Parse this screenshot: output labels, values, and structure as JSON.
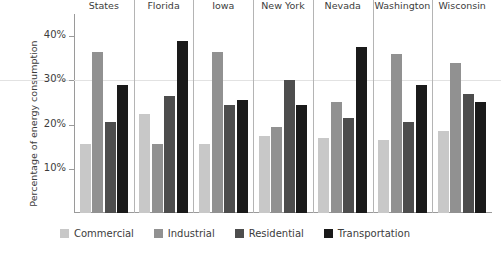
{
  "chart_data": {
    "type": "bar",
    "title": "",
    "xlabel": "",
    "ylabel": "Percentage of energy consumption",
    "ylim": [
      0,
      45
    ],
    "ytick_values": [
      10,
      20,
      30,
      40
    ],
    "ytick_labels": [
      "10%",
      "20%",
      "30%",
      "40%"
    ],
    "gridlines": [
      "30%"
    ],
    "legend_position": "bottom",
    "categories": [
      "United States",
      "Florida",
      "Iowa",
      "New York",
      "Nevada",
      "Washington",
      "Wisconsin"
    ],
    "series": [
      {
        "name": "Commercial",
        "color": "#c8c8c8",
        "values": [
          15.5,
          22.5,
          15.5,
          17.5,
          17.0,
          16.5,
          18.5
        ]
      },
      {
        "name": "Industrial",
        "color": "#919191",
        "values": [
          36.5,
          15.5,
          36.5,
          19.5,
          25.0,
          36.0,
          34.0
        ]
      },
      {
        "name": "Residential",
        "color": "#4d4d4d",
        "values": [
          20.5,
          26.5,
          24.5,
          30.0,
          21.5,
          20.5,
          27.0
        ]
      },
      {
        "name": "Transportation",
        "color": "#1a1a1a",
        "values": [
          29.0,
          39.0,
          25.5,
          24.5,
          37.5,
          29.0,
          25.0
        ]
      }
    ]
  }
}
